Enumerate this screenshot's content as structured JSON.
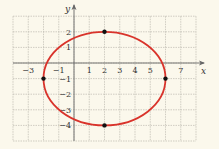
{
  "chart_data": {
    "type": "line",
    "title": "",
    "xlabel": "x",
    "ylabel": "y",
    "xlim": [
      -4,
      8
    ],
    "ylim": [
      -5,
      3
    ],
    "grid": true,
    "x_tick_labels": [
      "-3",
      "-1",
      "1",
      "2",
      "3",
      "4",
      "5",
      "7"
    ],
    "y_tick_labels": [
      "2",
      "1",
      "-1",
      "-2",
      "-3",
      "-4"
    ],
    "curve": {
      "shape": "ellipse",
      "center": [
        2,
        -1
      ],
      "semi_axis_x": 4,
      "semi_axis_y": 3,
      "color": "#d9332b"
    },
    "points": [
      {
        "x": 2,
        "y": 2
      },
      {
        "x": 2,
        "y": -4
      },
      {
        "x": -2,
        "y": -1
      },
      {
        "x": 6,
        "y": -1
      }
    ]
  },
  "labels": {
    "x_axis": "x",
    "y_axis": "y"
  }
}
